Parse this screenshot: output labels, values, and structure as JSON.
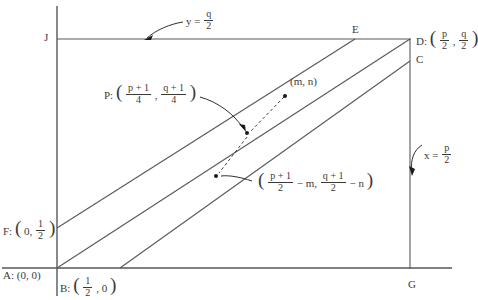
{
  "figure": {
    "line_color": "#55585c",
    "axis_color": "#55585c",
    "dot_color": "#1a1a1a",
    "text_color": "#3a3a3a"
  },
  "vertices": {
    "J": {
      "label": "J",
      "x": 47,
      "y": 39
    },
    "E": {
      "label": "E",
      "x": 352,
      "y": 31
    },
    "D": {
      "label": "D:",
      "x": 417,
      "y": 38
    },
    "C": {
      "label": "C",
      "x": 417,
      "y": 61
    },
    "G": {
      "label": "G",
      "x": 409,
      "y": 286
    },
    "A": {
      "label": "A: (0, 0)",
      "x": 3,
      "y": 277
    },
    "F_label": {
      "label": "F:",
      "x": 3,
      "y": 228
    },
    "B_label": {
      "label": "B:",
      "x": 60,
      "y": 285
    }
  },
  "annotations": {
    "y_equation": {
      "lhs": "y =",
      "num": "q",
      "den": "2",
      "x": 186,
      "y": 16
    },
    "x_equation": {
      "lhs": "x =",
      "num": "p",
      "den": "2",
      "x": 424,
      "y": 150
    },
    "m_n_point": {
      "label": "(m, n)",
      "x": 290,
      "y": 82
    },
    "P_label": {
      "prefix": "P:",
      "x": 104,
      "y": 92
    },
    "D_coords": {
      "num1": "p",
      "den1": "2",
      "num2": "q",
      "den2": "2"
    },
    "F_coords": {
      "zero": "0,",
      "num": "1",
      "den": "2"
    },
    "B_coords": {
      "num": "1",
      "den": "2",
      "suffix": ", 0"
    },
    "P_coords": {
      "num1": "p + 1",
      "den1": "4",
      "num2": "q + 1",
      "den2": "4"
    },
    "lower_coords": {
      "num1": "p + 1",
      "den1": "2",
      "term1": "− m,",
      "num2": "q + 1",
      "den2": "2",
      "term2": "− n",
      "x": 258,
      "y": 180
    }
  },
  "geometry": {
    "x_axis_y": 268,
    "y_axis_x": 57,
    "top_line_y": 39,
    "right_line_x": 410,
    "diagonals": [
      {
        "name": "F-to-E",
        "x1": 57,
        "y1": 228,
        "x2": 355,
        "y2": 39
      },
      {
        "name": "A-to-D",
        "x1": 57,
        "y1": 268,
        "x2": 410,
        "y2": 39
      },
      {
        "name": "B-to-C",
        "x1": 120,
        "y1": 268,
        "x2": 410,
        "y2": 61
      }
    ],
    "points": [
      {
        "name": "m-n-dot",
        "x": 285,
        "y": 96
      },
      {
        "name": "p-dot-upper",
        "x": 247,
        "y": 133
      },
      {
        "name": "p-dot-lower",
        "x": 216,
        "y": 176
      }
    ]
  }
}
